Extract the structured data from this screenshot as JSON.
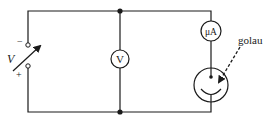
{
  "diagram": {
    "type": "circuit",
    "colors": {
      "line": "#1a1a1a",
      "background": "#ffffff"
    },
    "source": {
      "label": "V",
      "minus_label": "−",
      "plus_label": "+",
      "kind": "variable-voltage-source"
    },
    "voltmeter": {
      "label": "V"
    },
    "ammeter": {
      "label": "μA"
    },
    "photocell": {
      "annotation": "golau",
      "annotation_meaning": "light"
    },
    "junctions": 2
  }
}
